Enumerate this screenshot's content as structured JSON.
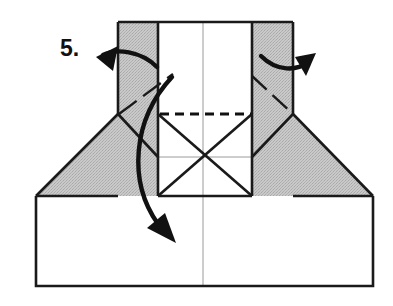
{
  "canvas": {
    "width": 393,
    "height": 306,
    "background": "#ffffff"
  },
  "diagram": {
    "type": "origami-fold-instruction",
    "step_label": "5.",
    "colors": {
      "paper_front": "#ffffff",
      "paper_back_shaded": "#c4c4c4",
      "outline": "#1a1a1a",
      "crease_thin": "#9a9a9a",
      "arrow": "#111111",
      "valley_dash": "#111111"
    },
    "shapes": {
      "base_panel": {
        "name": "bottom-base-panel",
        "points": "36,196 373,196 373,286 36,286"
      },
      "left_wing": {
        "name": "left-shaded-wing",
        "points": "36,196 118,114 158,158 158,196"
      },
      "right_wing": {
        "name": "right-shaded-wing",
        "points": "373,196 293,114 252,158 252,196"
      },
      "left_flap": {
        "name": "left-shaded-flap",
        "points": "118,22 158,22 158,196 118,196"
      },
      "right_flap": {
        "name": "right-shaded-flap",
        "points": "252,22 293,22 293,196 252,196"
      },
      "center_panel": {
        "name": "center-white-panel",
        "points": "158,22 252,22 252,196 158,196"
      }
    },
    "creases": {
      "vertical_center": {
        "name": "center-vertical-crease",
        "x1": 203,
        "y1": 22,
        "x2": 203,
        "y2": 286
      },
      "horizontal_mid": {
        "name": "mid-horizontal-crease",
        "x1": 158,
        "y1": 157,
        "x2": 252,
        "y2": 157
      },
      "x_cross_left": {
        "name": "x-crease-left",
        "x1": 158,
        "y1": 114,
        "x2": 252,
        "y2": 196
      },
      "x_cross_right": {
        "name": "x-crease-right",
        "x1": 252,
        "y1": 114,
        "x2": 158,
        "y2": 196
      }
    },
    "valley_fold": {
      "name": "dashed-valley-fold-line",
      "x1": 160,
      "y1": 114,
      "x2": 251,
      "y2": 114,
      "style": "dashed"
    },
    "dash_dot_folds": [
      {
        "name": "left-flap-dashdot-fold",
        "x1": 119,
        "y1": 114,
        "x2": 173,
        "y2": 74
      },
      {
        "name": "right-flap-dashdot-fold",
        "x1": 252,
        "y1": 76,
        "x2": 293,
        "y2": 114
      }
    ],
    "arrows": [
      {
        "name": "left-unfold-arrow",
        "direction": "left",
        "path": "M 156,66 C 140,52 114,50 101,56",
        "head": "99,57 116,49 113,69"
      },
      {
        "name": "right-unfold-arrow",
        "direction": "right",
        "path": "M 262,56 C 278,72 298,70 310,60",
        "head": "315,56 296,58 305,74"
      },
      {
        "name": "center-fold-down-arrow",
        "direction": "down",
        "path": "M 171,78 C 133,122 129,182 160,226",
        "head": "174,239 153,230 164,216"
      }
    ]
  }
}
